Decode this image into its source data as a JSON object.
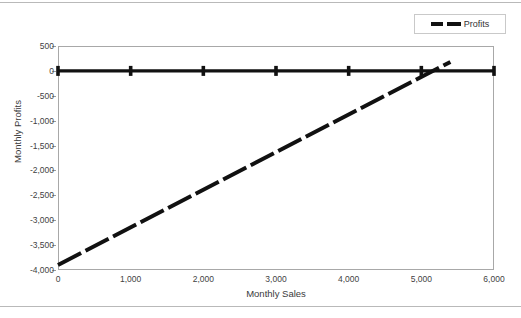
{
  "legend": {
    "position": "top-right",
    "entries": [
      {
        "label": "Profits",
        "style": "dashed",
        "color": "#111111"
      }
    ]
  },
  "axes": {
    "y_title": "Monthly Profits",
    "x_title": "Monthly Sales",
    "y_ticks": [
      "500",
      "0",
      "-500",
      "-1,000",
      "-1,500",
      "-2,000",
      "-2,500",
      "-3,000",
      "-3,500",
      "-4,000"
    ],
    "x_ticks": [
      "0",
      "1,000",
      "2,000",
      "3,000",
      "4,000",
      "5,000",
      "6,000"
    ]
  },
  "chart_data": {
    "type": "line",
    "title": "",
    "xlabel": "Monthly Sales",
    "ylabel": "Monthly Profits",
    "xlim": [
      0,
      6000
    ],
    "ylim": [
      -4000,
      500
    ],
    "grid": false,
    "legend_position": "top-right",
    "x": [
      0,
      1000,
      2000,
      3000,
      4000,
      5000,
      6000
    ],
    "series": [
      {
        "name": "Break-even",
        "style": "solid",
        "color": "#111111",
        "marker": "plus",
        "values": [
          0,
          0,
          0,
          0,
          0,
          0,
          0
        ]
      },
      {
        "name": "Profits",
        "style": "dashed",
        "color": "#111111",
        "marker": "none",
        "x": [
          0,
          5400
        ],
        "values": [
          -3900,
          180
        ]
      }
    ],
    "annotations": [
      {
        "text": "break-even crossing",
        "x": 5250,
        "y": 0
      }
    ]
  }
}
